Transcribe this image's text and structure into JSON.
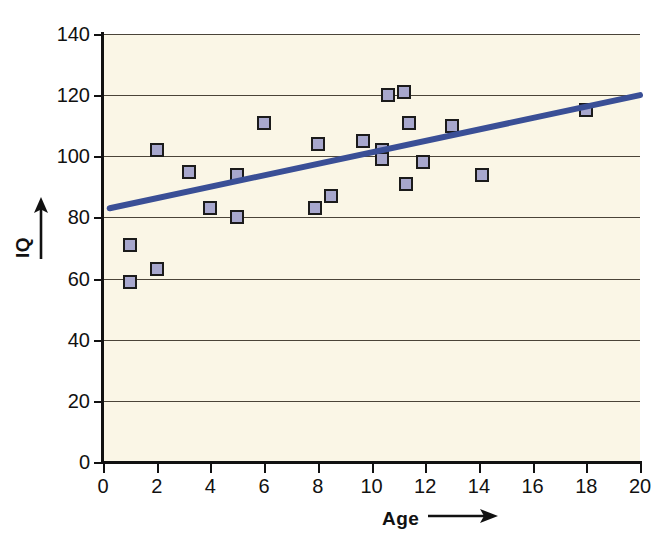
{
  "chart_data": {
    "type": "scatter",
    "title": "",
    "xlabel": "Age",
    "ylabel": "IQ",
    "xlim": [
      0,
      20
    ],
    "ylim": [
      0,
      140
    ],
    "xticks": [
      0,
      2,
      4,
      6,
      8,
      10,
      12,
      14,
      16,
      18,
      20
    ],
    "yticks": [
      0,
      20,
      40,
      60,
      80,
      100,
      120,
      140
    ],
    "xtick_labels": [
      "0",
      "2",
      "4",
      "6",
      "8",
      "10",
      "12",
      "14",
      "16",
      "18",
      "20"
    ],
    "ytick_labels": [
      "0",
      "20",
      "40",
      "60",
      "80",
      "100",
      "120",
      "140"
    ],
    "grid": "horizontal",
    "legend": "none",
    "plot_background": "#faf6e6",
    "marker_fill": "#a7a7cd",
    "marker_edge": "#1b1b1b",
    "marker_shape": "square",
    "trendline_color": "#3a4f96",
    "series": [
      {
        "name": "IQ vs Age",
        "points": [
          {
            "x": 1.0,
            "y": 59
          },
          {
            "x": 1.0,
            "y": 71
          },
          {
            "x": 2.0,
            "y": 63
          },
          {
            "x": 2.0,
            "y": 102
          },
          {
            "x": 3.2,
            "y": 95
          },
          {
            "x": 4.0,
            "y": 83
          },
          {
            "x": 5.0,
            "y": 80
          },
          {
            "x": 5.0,
            "y": 94
          },
          {
            "x": 6.0,
            "y": 111
          },
          {
            "x": 7.9,
            "y": 83
          },
          {
            "x": 8.0,
            "y": 104
          },
          {
            "x": 8.5,
            "y": 87
          },
          {
            "x": 9.7,
            "y": 105
          },
          {
            "x": 10.4,
            "y": 102
          },
          {
            "x": 10.4,
            "y": 99
          },
          {
            "x": 10.6,
            "y": 120
          },
          {
            "x": 11.2,
            "y": 121
          },
          {
            "x": 11.3,
            "y": 91
          },
          {
            "x": 11.4,
            "y": 111
          },
          {
            "x": 11.9,
            "y": 98
          },
          {
            "x": 13.0,
            "y": 110
          },
          {
            "x": 14.1,
            "y": 94
          },
          {
            "x": 18.0,
            "y": 115
          }
        ]
      }
    ],
    "trendline": {
      "name": "linear fit",
      "x_start": 0.25,
      "y_start": 83,
      "x_end": 20.0,
      "y_end": 120
    }
  },
  "axes": {
    "y_title": "IQ",
    "x_title": "Age",
    "y_arrow_icon": "up-arrow-icon",
    "x_arrow_icon": "right-arrow-icon"
  }
}
